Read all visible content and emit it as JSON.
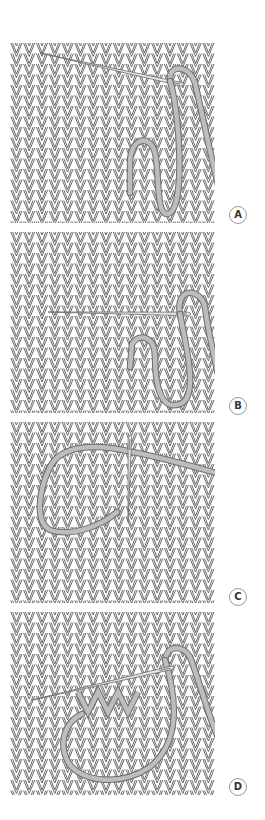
{
  "diagram": {
    "colors": {
      "background": "#ffffff",
      "stitch_line": "#5a5a5a",
      "yarn_fill": "#bdbdbd",
      "yarn_edge": "#6e6e6e",
      "needle_fill": "#e6e6e6",
      "needle_edge": "#6a6a6a",
      "label_border": "#9a9a9a",
      "label_text": "#333333"
    },
    "panels": [
      {
        "id": "a",
        "label": "A",
        "step": "needle inserted diagonally upward through stitches"
      },
      {
        "id": "b",
        "label": "B",
        "step": "needle passed horizontally across center row"
      },
      {
        "id": "c",
        "label": "C",
        "step": "needle inserted vertically, yarn looped to left"
      },
      {
        "id": "d",
        "label": "D",
        "step": "needle inserted diagonally, duplicated V stitches shown in yarn"
      }
    ]
  }
}
